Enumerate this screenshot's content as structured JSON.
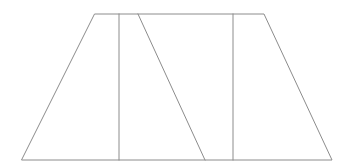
{
  "figure": {
    "background_color": "#ffffff",
    "stroke_color": "#8c8c8c",
    "fill_color": "#ffffff",
    "stroke_width": 1,
    "canvas": {
      "width": 348,
      "height": 167
    }
  },
  "chart_data": {
    "type": "diagram",
    "xlabel": "",
    "ylabel": "",
    "xlim": [
      0,
      348
    ],
    "ylim": [
      0,
      167
    ],
    "grid": false,
    "legend": "none",
    "shapes": [
      {
        "name": "outer-trapezoid",
        "kind": "polygon",
        "closed": true,
        "points": [
          [
            95,
            14
          ],
          [
            264,
            14
          ],
          [
            332,
            160
          ],
          [
            22,
            160
          ]
        ],
        "points_attr": "95,14 264,14 332,160 22,160",
        "stroke": "#8c8c8c",
        "fill": "#ffffff"
      },
      {
        "name": "interior-vertical-left",
        "kind": "line",
        "x1": 119,
        "y1": 14,
        "x2": 119,
        "y2": 160,
        "stroke": "#8c8c8c"
      },
      {
        "name": "interior-diagonal",
        "kind": "line",
        "x1": 138,
        "y1": 14,
        "x2": 205,
        "y2": 160,
        "stroke": "#8c8c8c"
      },
      {
        "name": "interior-vertical-right",
        "kind": "line",
        "x1": 233,
        "y1": 14,
        "x2": 233,
        "y2": 160,
        "stroke": "#8c8c8c"
      }
    ],
    "vertices": {
      "top_left": [
        95,
        14
      ],
      "top_right": [
        264,
        14
      ],
      "bottom_right": [
        332,
        160
      ],
      "bottom_left": [
        22,
        160
      ]
    },
    "measurements": {
      "top_edge_length_px": 169,
      "bottom_edge_length_px": 310,
      "height_px": 146
    },
    "labels": []
  }
}
